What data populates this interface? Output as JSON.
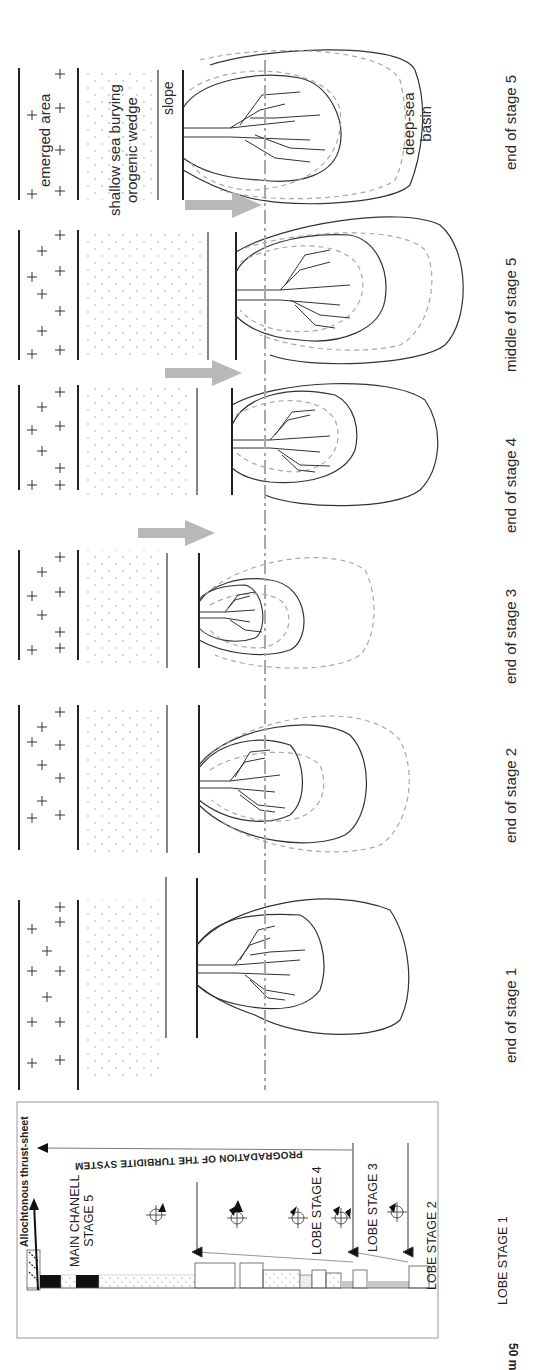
{
  "figure": {
    "orientation": "rotated 90 degrees clockwise (text reads bottom-to-top)",
    "stages": [
      {
        "id": "stage-1",
        "label": "end of stage 1"
      },
      {
        "id": "stage-2",
        "label": "end of stage 2"
      },
      {
        "id": "stage-3",
        "label": "end of stage 3"
      },
      {
        "id": "stage-4",
        "label": "end of stage 4"
      },
      {
        "id": "stage-5-mid",
        "label": "middle of stage 5"
      },
      {
        "id": "stage-5-end",
        "label": "end of stage 5"
      }
    ],
    "annotations": {
      "emerged_area": "emerged area",
      "shallow_sea_line1": "shallow sea burying",
      "shallow_sea_line2": "orogenic wedge",
      "slope": "slope",
      "deep_sea_line1": "deep-sea",
      "deep_sea_line2": "basin"
    },
    "log_panel": {
      "thrust_sheet": "Allochtonous thrust-sheet",
      "progradation": "PROGRADATION OF THE TURBIDITE SYSTEM",
      "main_channel_line1": "MAIN CHANELL",
      "main_channel_line2": "STAGE 5",
      "lobe_4": "LOBE STAGE 4",
      "lobe_3": "LOBE STAGE 3",
      "lobe_2": "LOBE STAGE 2",
      "lobe_1": "LOBE STAGE 1",
      "scale_bar": "50 m"
    },
    "colors": {
      "line": "#222222",
      "dashed_gray": "#a8a8a8",
      "arrow_gray": "#b4b4b4",
      "dots": "#c4c4c4",
      "panel_border": "#9a9a9a"
    }
  }
}
